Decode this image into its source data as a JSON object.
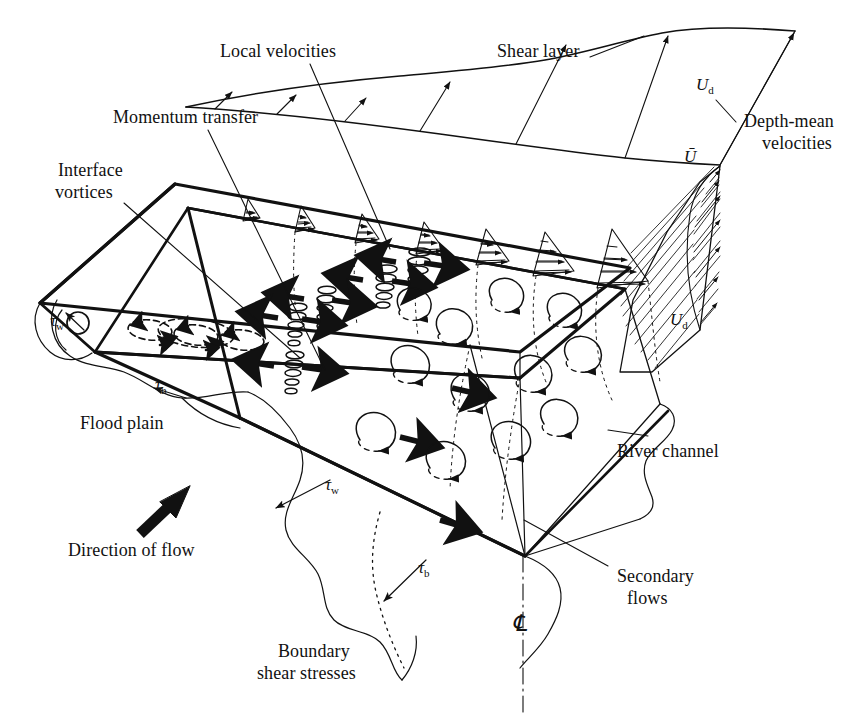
{
  "figure": {
    "type": "schematic-diagram",
    "background_color": "#ffffff",
    "ink_color": "#111111"
  },
  "labels": {
    "local_velocities": "Local velocities",
    "shear_layer": "Shear layer",
    "momentum_transfer": "Momentum transfer",
    "depth_mean_velocities_line1": "Depth-mean",
    "depth_mean_velocities_line2": "velocities",
    "interface_vortices_line1": "Interface",
    "interface_vortices_line2": "vortices",
    "flood_plain": "Flood plain",
    "river_channel": "River channel",
    "direction_of_flow": "Direction of flow",
    "secondary_flows_line1": "Secondary",
    "secondary_flows_line2": "flows",
    "boundary_shear_stresses_line1": "Boundary",
    "boundary_shear_stresses_line2": "shear stresses"
  },
  "symbols": {
    "tau_w_left": {
      "base": "τ",
      "sub": "w"
    },
    "tau_b_left": {
      "base": "τ",
      "sub": "b"
    },
    "tau_w_mid": {
      "base": "τ",
      "sub": "w"
    },
    "tau_b_right": {
      "base": "τ",
      "sub": "b"
    },
    "u_d_top": {
      "base": "U",
      "sub": "d"
    },
    "u_bar": {
      "base": "Ū",
      "sub": ""
    },
    "u_d_right": {
      "base": "U",
      "sub": "d"
    },
    "centreline": "℄"
  },
  "geometry": {
    "floodplain_top_surface": "left raised plain bounded by bold lines",
    "main_channel_block": "central sunken river channel prism",
    "interface_vortex_count": 5,
    "local_velocity_profile_count": 7,
    "secondary_flow_cell_count": 12
  }
}
